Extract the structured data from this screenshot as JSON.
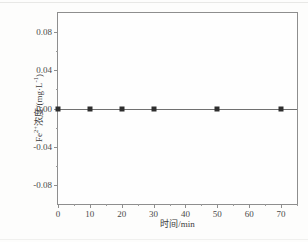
{
  "chart_data": {
    "type": "line",
    "title": "",
    "subtitle": "",
    "xlabel": "时间/min",
    "ylabel": "Fe2+浓度/(mg·L-1)",
    "ylabel_parts": {
      "species": "Fe",
      "charge": "2+",
      "text": "浓度/(mg·L",
      "exponent": "-1",
      "close": ")"
    },
    "xlim": [
      0,
      75
    ],
    "ylim": [
      -0.1,
      0.1
    ],
    "grid": false,
    "legend": false,
    "legend_position": "none",
    "x_major_ticks": [
      0,
      10,
      20,
      30,
      40,
      50,
      60,
      70
    ],
    "x_tick_labels": [
      "0",
      "10",
      "20",
      "30",
      "40",
      "50",
      "60",
      "70"
    ],
    "x_minor_ticks": [
      5,
      15,
      25,
      35,
      45,
      55,
      65,
      75
    ],
    "y_major_ticks": [
      0.08,
      0.04,
      0.0,
      -0.04,
      -0.08
    ],
    "y_tick_labels": [
      "0.08",
      "0.04",
      "0.00",
      "-0.04",
      "-0.08"
    ],
    "y_minor_ticks": [
      0.06,
      0.02,
      -0.02,
      -0.06
    ],
    "series": [
      {
        "name": "Fe2+ concentration",
        "marker": "filled-square",
        "color": "#2e2e2e",
        "line_color": "#707070",
        "x": [
          0,
          10,
          20,
          30,
          50,
          70
        ],
        "values": [
          0.0,
          0.0,
          0.0,
          0.0,
          0.0,
          0.0
        ]
      }
    ],
    "line_span": {
      "x_start": 0,
      "x_end": 75,
      "y": 0.0
    }
  },
  "colors": {
    "frame": "#8e8e8e",
    "marker": "#2e2e2e",
    "line": "#707070",
    "tick_text": "#4a4a4a",
    "axis_title": "#3c3c3c",
    "background": "#fdfdfc",
    "plot_background": "#fefefe"
  }
}
